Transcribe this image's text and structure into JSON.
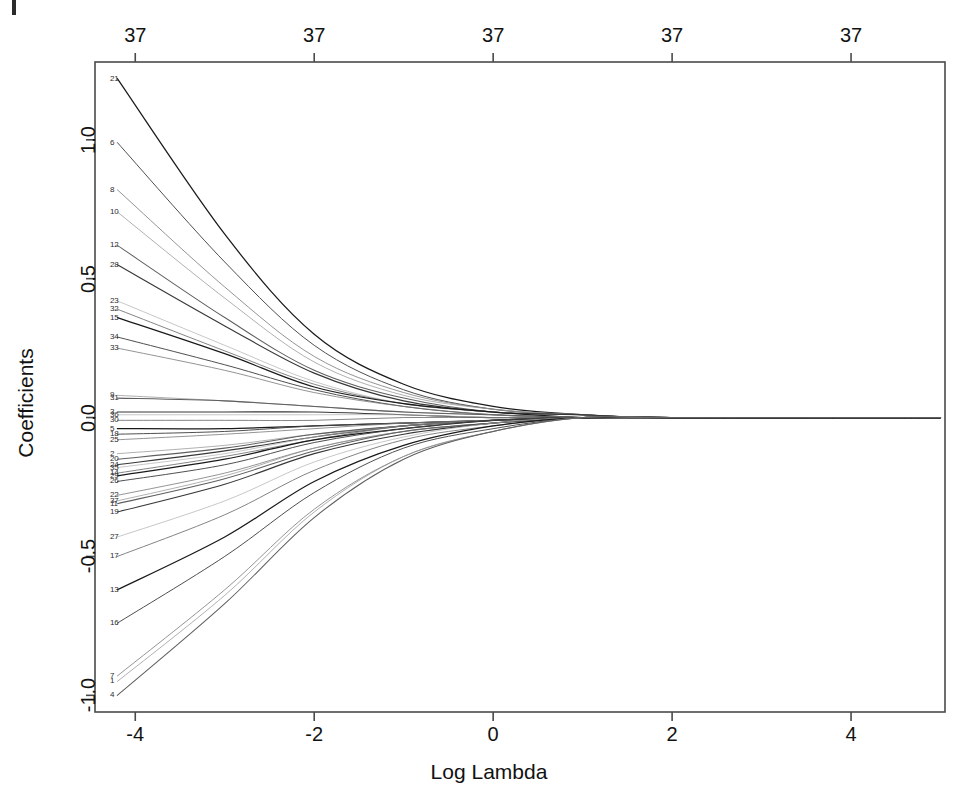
{
  "figure": {
    "background_color": "#ffffff",
    "line_color_dark": "#1c1c1c",
    "line_color_light": "#b9b9b9",
    "frame_color": "#4a4a4a"
  },
  "chart_data": {
    "type": "line",
    "title": "",
    "xlabel": "Log Lambda",
    "ylabel": "Coefficients",
    "xlim": [
      -4.45,
      5.05
    ],
    "ylim": [
      -1.06,
      1.28
    ],
    "grid": false,
    "legend": "none",
    "x_ticks": [
      "-4",
      "-2",
      "0",
      "2",
      "4"
    ],
    "x_tick_values": [
      -4,
      -2,
      0,
      2,
      4
    ],
    "y_ticks": [
      "-1.0",
      "-0.5",
      "0.0",
      "0.5",
      "1.0"
    ],
    "y_tick_values": [
      -1.0,
      -0.5,
      0.0,
      0.5,
      1.0
    ],
    "top_axis_label": "Number of nonzero coefficients",
    "top_ticks": [
      "37",
      "37",
      "37",
      "37",
      "37"
    ],
    "top_tick_values": [
      -4,
      -2,
      0,
      2,
      4
    ],
    "n_series": 37,
    "series": [
      {
        "name": "21",
        "label_y": 1.22,
        "values": [
          1.22,
          0.66,
          0.3,
          0.12,
          0.04,
          0.01,
          0.0,
          0.0
        ]
      },
      {
        "name": "6",
        "label_y": 0.99,
        "values": [
          0.99,
          0.56,
          0.26,
          0.1,
          0.03,
          0.01,
          0.0,
          0.0
        ]
      },
      {
        "name": "8",
        "label_y": 0.82,
        "values": [
          0.82,
          0.47,
          0.22,
          0.09,
          0.03,
          0.01,
          0.0,
          0.0
        ]
      },
      {
        "name": "10",
        "label_y": 0.74,
        "values": [
          0.74,
          0.43,
          0.2,
          0.08,
          0.03,
          0.01,
          0.0,
          0.0
        ]
      },
      {
        "name": "12",
        "label_y": 0.62,
        "values": [
          0.62,
          0.36,
          0.17,
          0.07,
          0.02,
          0.01,
          0.0,
          0.0
        ]
      },
      {
        "name": "28",
        "label_y": 0.55,
        "values": [
          0.55,
          0.33,
          0.16,
          0.06,
          0.02,
          0.01,
          0.0,
          0.0
        ]
      },
      {
        "name": "23",
        "label_y": 0.42,
        "values": [
          0.42,
          0.26,
          0.13,
          0.05,
          0.02,
          0.0,
          0.0,
          0.0
        ]
      },
      {
        "name": "32",
        "label_y": 0.39,
        "values": [
          0.39,
          0.24,
          0.12,
          0.05,
          0.02,
          0.0,
          0.0,
          0.0
        ]
      },
      {
        "name": "15",
        "label_y": 0.36,
        "values": [
          0.36,
          0.23,
          0.11,
          0.05,
          0.02,
          0.0,
          0.0,
          0.0
        ]
      },
      {
        "name": "34",
        "label_y": 0.29,
        "values": [
          0.29,
          0.19,
          0.1,
          0.04,
          0.01,
          0.0,
          0.0,
          0.0
        ]
      },
      {
        "name": "33",
        "label_y": 0.25,
        "values": [
          0.25,
          0.17,
          0.09,
          0.04,
          0.01,
          0.0,
          0.0,
          0.0
        ]
      },
      {
        "name": "9",
        "label_y": 0.08,
        "values": [
          0.08,
          0.06,
          0.04,
          0.02,
          0.01,
          0.0,
          0.0,
          0.0
        ]
      },
      {
        "name": "31",
        "label_y": 0.07,
        "values": [
          0.07,
          0.06,
          0.04,
          0.02,
          0.01,
          0.0,
          0.0,
          0.0
        ]
      },
      {
        "name": "3",
        "label_y": 0.02,
        "values": [
          0.02,
          0.02,
          0.02,
          0.01,
          0.0,
          0.0,
          0.0,
          0.0
        ]
      },
      {
        "name": "36",
        "label_y": 0.01,
        "values": [
          0.01,
          0.01,
          0.01,
          0.01,
          0.0,
          0.0,
          0.0,
          0.0
        ]
      },
      {
        "name": "30",
        "label_y": -0.01,
        "values": [
          -0.01,
          -0.01,
          -0.01,
          0.0,
          0.0,
          0.0,
          0.0,
          0.0
        ]
      },
      {
        "name": "5",
        "label_y": -0.04,
        "values": [
          -0.04,
          -0.04,
          -0.03,
          -0.02,
          -0.01,
          0.0,
          0.0,
          0.0
        ]
      },
      {
        "name": "18",
        "label_y": -0.06,
        "values": [
          -0.06,
          -0.05,
          -0.03,
          -0.02,
          -0.01,
          0.0,
          0.0,
          0.0
        ]
      },
      {
        "name": "25",
        "label_y": -0.08,
        "values": [
          -0.08,
          -0.06,
          -0.04,
          -0.02,
          -0.01,
          0.0,
          0.0,
          0.0
        ]
      },
      {
        "name": "2",
        "label_y": -0.13,
        "values": [
          -0.13,
          -0.1,
          -0.06,
          -0.03,
          -0.01,
          0.0,
          0.0,
          0.0
        ]
      },
      {
        "name": "20",
        "label_y": -0.15,
        "values": [
          -0.15,
          -0.11,
          -0.06,
          -0.03,
          -0.01,
          0.0,
          0.0,
          0.0
        ]
      },
      {
        "name": "24",
        "label_y": -0.17,
        "values": [
          -0.17,
          -0.12,
          -0.07,
          -0.03,
          -0.01,
          0.0,
          0.0,
          0.0
        ]
      },
      {
        "name": "35",
        "label_y": -0.18,
        "values": [
          -0.18,
          -0.13,
          -0.07,
          -0.03,
          -0.01,
          0.0,
          0.0,
          0.0
        ]
      },
      {
        "name": "14",
        "label_y": -0.2,
        "values": [
          -0.2,
          -0.14,
          -0.08,
          -0.03,
          -0.01,
          0.0,
          0.0,
          0.0
        ]
      },
      {
        "name": "29",
        "label_y": -0.21,
        "values": [
          -0.21,
          -0.15,
          -0.08,
          -0.04,
          -0.01,
          0.0,
          0.0,
          0.0
        ]
      },
      {
        "name": "26",
        "label_y": -0.23,
        "values": [
          -0.23,
          -0.17,
          -0.09,
          -0.04,
          -0.01,
          0.0,
          0.0,
          0.0
        ]
      },
      {
        "name": "22",
        "label_y": -0.28,
        "values": [
          -0.28,
          -0.2,
          -0.11,
          -0.05,
          -0.02,
          0.0,
          0.0,
          0.0
        ]
      },
      {
        "name": "37",
        "label_y": -0.3,
        "values": [
          -0.3,
          -0.21,
          -0.11,
          -0.05,
          -0.02,
          0.0,
          0.0,
          0.0
        ]
      },
      {
        "name": "11",
        "label_y": -0.31,
        "values": [
          -0.31,
          -0.22,
          -0.12,
          -0.05,
          -0.02,
          0.0,
          0.0,
          0.0
        ]
      },
      {
        "name": "19",
        "label_y": -0.34,
        "values": [
          -0.34,
          -0.24,
          -0.13,
          -0.06,
          -0.02,
          0.0,
          0.0,
          0.0
        ]
      },
      {
        "name": "27",
        "label_y": -0.43,
        "values": [
          -0.43,
          -0.3,
          -0.16,
          -0.07,
          -0.02,
          0.0,
          0.0,
          0.0
        ]
      },
      {
        "name": "17",
        "label_y": -0.5,
        "values": [
          -0.5,
          -0.35,
          -0.19,
          -0.08,
          -0.03,
          0.0,
          0.0,
          0.0
        ]
      },
      {
        "name": "13",
        "label_y": -0.62,
        "values": [
          -0.62,
          -0.43,
          -0.23,
          -0.1,
          -0.03,
          0.0,
          0.0,
          0.0
        ]
      },
      {
        "name": "16",
        "label_y": -0.74,
        "values": [
          -0.74,
          -0.5,
          -0.27,
          -0.11,
          -0.04,
          0.0,
          0.0,
          0.0
        ]
      },
      {
        "name": "7",
        "label_y": -0.93,
        "values": [
          -0.93,
          -0.62,
          -0.33,
          -0.14,
          -0.05,
          0.0,
          0.0,
          0.0
        ]
      },
      {
        "name": "1",
        "label_y": -0.95,
        "values": [
          -0.95,
          -0.64,
          -0.34,
          -0.14,
          -0.05,
          0.0,
          0.0,
          0.0
        ]
      },
      {
        "name": "4",
        "label_y": -1.0,
        "values": [
          -1.0,
          -0.67,
          -0.36,
          -0.15,
          -0.05,
          0.0,
          0.0,
          0.0
        ]
      }
    ],
    "x": [
      -4.2,
      -3.0,
      -2.0,
      -1.0,
      0.0,
      1.0,
      2.0,
      5.0
    ]
  }
}
